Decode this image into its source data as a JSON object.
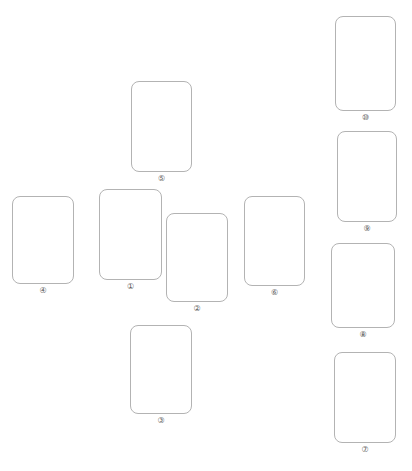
{
  "canvas": {
    "width": 412,
    "height": 471,
    "background": "#ffffff",
    "title": ""
  },
  "style": {
    "card_fill": "#ffffff",
    "card_stroke": "#b3b3b3",
    "card_stroke_width": 1,
    "card_corner_radius": 8,
    "label_color": "#5a5a5a",
    "label_font_size": 8
  },
  "cards": [
    {
      "id": "card-1",
      "label": "①",
      "number": 1,
      "x": 99,
      "y": 189,
      "width": 63,
      "height": 91,
      "label_y": 282
    },
    {
      "id": "card-2",
      "label": "②",
      "number": 2,
      "x": 166,
      "y": 213,
      "width": 62,
      "height": 89,
      "label_y": 304
    },
    {
      "id": "card-3",
      "label": "③",
      "number": 3,
      "x": 130,
      "y": 325,
      "width": 62,
      "height": 89,
      "label_y": 416
    },
    {
      "id": "card-4",
      "label": "④",
      "number": 4,
      "x": 12,
      "y": 196,
      "width": 62,
      "height": 88,
      "label_y": 286
    },
    {
      "id": "card-5",
      "label": "⑤",
      "number": 5,
      "x": 131,
      "y": 81,
      "width": 61,
      "height": 91,
      "label_y": 174
    },
    {
      "id": "card-6",
      "label": "⑥",
      "number": 6,
      "x": 244,
      "y": 196,
      "width": 61,
      "height": 90,
      "label_y": 288
    },
    {
      "id": "card-7",
      "label": "⑦",
      "number": 7,
      "x": 334,
      "y": 352,
      "width": 62,
      "height": 91,
      "label_y": 445
    },
    {
      "id": "card-8",
      "label": "⑧",
      "number": 8,
      "x": 331,
      "y": 243,
      "width": 64,
      "height": 85,
      "label_y": 330
    },
    {
      "id": "card-9",
      "label": "⑨",
      "number": 9,
      "x": 337,
      "y": 131,
      "width": 60,
      "height": 91,
      "label_y": 224
    },
    {
      "id": "card-10",
      "label": "⑩",
      "number": 10,
      "x": 335,
      "y": 16,
      "width": 61,
      "height": 95,
      "label_y": 113
    }
  ]
}
